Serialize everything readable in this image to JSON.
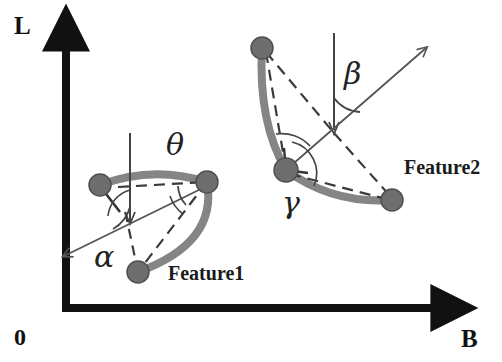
{
  "figure": {
    "background_color": "#ffffff",
    "ink_color": "#111111",
    "curve_color": "#808080",
    "node_color": "#6e6e6e",
    "thin_line_color": "#555555",
    "axes": {
      "vertical_axis_label": "L",
      "horizontal_axis_label": "B",
      "origin_label": "0",
      "vertical_axis": {
        "x": 66,
        "y_top": 28,
        "y_bottom": 308
      },
      "horizontal_axis": {
        "y": 308,
        "x_left": 66,
        "x_right": 455
      }
    },
    "features": [
      {
        "id": "feature1",
        "label": "Feature1",
        "label_pos": {
          "x": 168,
          "y": 280
        },
        "nodes": [
          {
            "name": "node-left",
            "x": 100,
            "y": 185,
            "r": 11
          },
          {
            "name": "node-right",
            "x": 207,
            "y": 182,
            "r": 11
          },
          {
            "name": "node-bottom",
            "x": 138,
            "y": 272,
            "r": 11
          }
        ],
        "reference_line": {
          "x": 130,
          "y_top": 133,
          "y_bottom": 225
        },
        "angle_labels": [
          {
            "symbol": "θ",
            "name": "theta",
            "x": 166,
            "y": 155
          },
          {
            "symbol": "α",
            "name": "alpha",
            "x": 94,
            "y": 267
          }
        ],
        "direction_arrow": {
          "x1": 130,
          "y1": 212,
          "x2": 62,
          "y2": 258
        }
      },
      {
        "id": "feature2",
        "label": "Feature2",
        "label_pos": {
          "x": 404,
          "y": 174
        },
        "nodes": [
          {
            "name": "node-top",
            "x": 262,
            "y": 48,
            "r": 11
          },
          {
            "name": "node-vertex",
            "x": 286,
            "y": 170,
            "r": 12
          },
          {
            "name": "node-bottom-right",
            "x": 392,
            "y": 200,
            "r": 11
          }
        ],
        "reference_line": {
          "x": 334,
          "y_top": 33,
          "y_bottom": 135
        },
        "angle_labels": [
          {
            "symbol": "β",
            "name": "beta",
            "x": 344,
            "y": 84
          },
          {
            "symbol": "γ",
            "name": "gamma",
            "x": 282,
            "y": 213
          }
        ],
        "direction_arrow": {
          "x1": 300,
          "y1": 163,
          "x2": 428,
          "y2": 46
        }
      }
    ]
  }
}
